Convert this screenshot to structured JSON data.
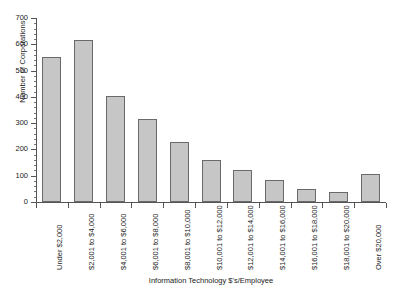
{
  "chart_data": {
    "type": "bar",
    "title": "",
    "xlabel": "Information Technology $'s/Employee",
    "ylabel": "Number of Corporations",
    "ylim": [
      0,
      700
    ],
    "ytick_step": 100,
    "yticks": [
      "0",
      "100",
      "200",
      "300",
      "400",
      "500",
      "600",
      "700"
    ],
    "grid": false,
    "legend": false,
    "bar_color": "#c6c6c6",
    "bar_edge_color": "#6a6a6a",
    "categories": [
      "Under $2,000",
      "$2,001 to $4,000",
      "$4,001 to $6,000",
      "$6,001 to $8,000",
      "$8,001 to $10,000",
      "$10,001 to $12,000",
      "$12,001 to $14,000",
      "$14,001 to $16,000",
      "$16,001 to $18,000",
      "$18,001 to $20,000",
      "Over $20,000"
    ],
    "values": [
      550,
      615,
      405,
      315,
      230,
      160,
      120,
      85,
      50,
      40,
      105
    ]
  }
}
